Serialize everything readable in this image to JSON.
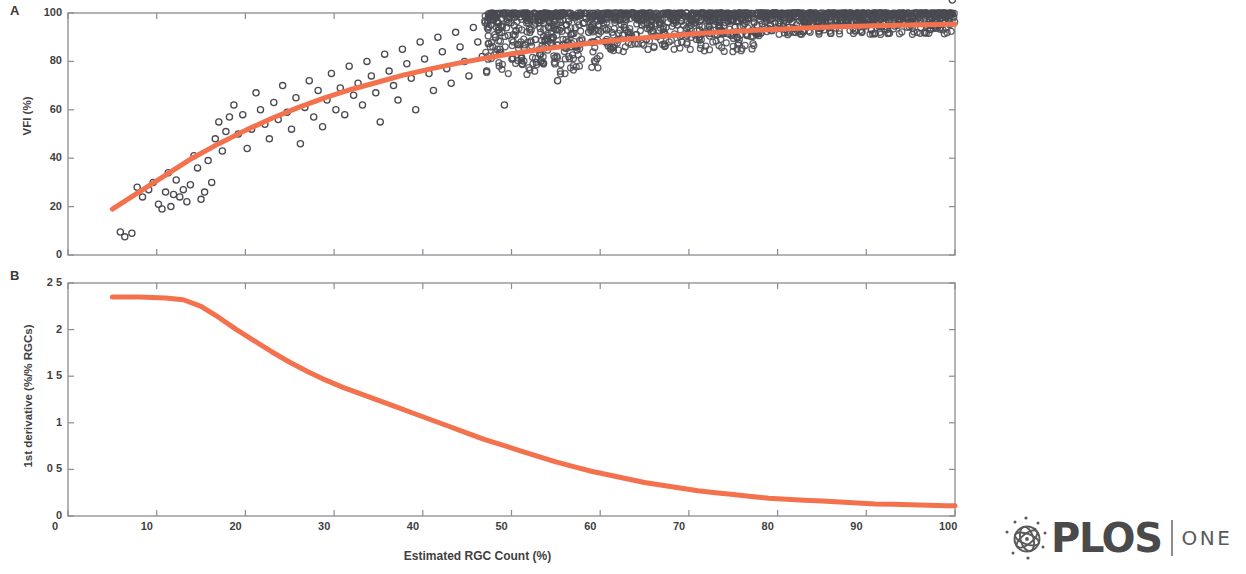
{
  "figure": {
    "panel_a_letter": "A",
    "panel_b_letter": "B",
    "xlabel": "Estimated RGC Count (%)",
    "ylabel_a": "VFI (%)",
    "ylabel_b": "1st derivative (%/% RGCs)"
  },
  "logo": {
    "wordmark": "PLOS",
    "journal": "ONE",
    "emblem_icon": "plos-sphere-icon"
  },
  "colors": {
    "curve": "#F4714E",
    "marker_stroke": "#4a4a52",
    "axis": "#8b8b93",
    "text": "#3f3f42"
  },
  "chart_data": [
    {
      "type": "scatter",
      "panel": "A",
      "title": "",
      "xlabel": "Estimated RGC Count (%)",
      "ylabel": "VFI (%)",
      "xlim": [
        0,
        100
      ],
      "ylim": [
        0,
        100
      ],
      "xticks": [
        0,
        10,
        20,
        30,
        40,
        50,
        60,
        70,
        80,
        90,
        100
      ],
      "yticks": [
        0,
        20,
        40,
        60,
        80,
        100
      ],
      "xtick_labels": [
        "0",
        "10",
        "20",
        "30",
        "40",
        "50",
        "60",
        "70",
        "80",
        "90",
        "100"
      ],
      "ytick_labels": [
        "0",
        "20",
        "40",
        "60",
        "80",
        "100"
      ],
      "grid": false,
      "legend": "none",
      "marker": "open-circle",
      "series": [
        {
          "name": "Observed eyes",
          "x": [
            5.9,
            6.4,
            7.2,
            7.8,
            8.4,
            9.1,
            9.6,
            10.2,
            10.6,
            11.0,
            11.3,
            11.6,
            11.9,
            12.2,
            12.6,
            13.0,
            13.4,
            13.8,
            14.2,
            14.6,
            15.0,
            15.4,
            15.8,
            16.2,
            16.6,
            17.0,
            17.4,
            17.8,
            18.2,
            18.7,
            19.2,
            19.7,
            20.2,
            20.7,
            21.2,
            21.7,
            22.2,
            22.7,
            23.2,
            23.7,
            24.2,
            24.7,
            25.2,
            25.7,
            26.2,
            26.7,
            27.2,
            27.7,
            28.2,
            28.7,
            29.2,
            29.7,
            30.2,
            30.7,
            31.2,
            31.7,
            32.2,
            32.7,
            33.2,
            33.7,
            34.2,
            34.7,
            35.2,
            35.7,
            36.2,
            36.7,
            37.2,
            37.7,
            38.2,
            38.7,
            39.2,
            39.7,
            40.2,
            40.7,
            41.2,
            41.7,
            42.2,
            42.7,
            43.2,
            43.7,
            44.2,
            44.7,
            45.2,
            45.7,
            46.2,
            46.7,
            47.2,
            47.7,
            48.2,
            48.7,
            49.2,
            49.7,
            50.2,
            50.7,
            51.2,
            51.7,
            52.2,
            52.7,
            53.2,
            53.7,
            54.2,
            54.7,
            55.2,
            55.7,
            56.2,
            56.7,
            57.2,
            57.7,
            58.2,
            58.7,
            59.2,
            59.7,
            60.2,
            60.7,
            61.2,
            61.7,
            62.2,
            62.7,
            63.2,
            63.7,
            64.2,
            64.7,
            65.2,
            65.7,
            66.2,
            66.7,
            67.2,
            67.7,
            68.2,
            68.7,
            69.2,
            69.7,
            70.2,
            70.7,
            71.2,
            71.7,
            72.2,
            72.7,
            73.2,
            73.7,
            74.2,
            74.7,
            75.2,
            75.7,
            76.2,
            76.7,
            77.2,
            77.7,
            78.2,
            78.7,
            79.2,
            79.7,
            80.2,
            80.7,
            81.2,
            81.7,
            82.2,
            82.7,
            83.2,
            83.7,
            84.2,
            84.7,
            85.2,
            85.7,
            86.2,
            86.7,
            87.2,
            87.7,
            88.2,
            88.7,
            89.2,
            89.7,
            90.2,
            90.7,
            91.2,
            91.7,
            92.2,
            92.7,
            93.2,
            93.7,
            94.2,
            94.7,
            95.2,
            95.7,
            96.2,
            96.7,
            97.2,
            97.7,
            98.2,
            98.7,
            99.2,
            99.7
          ],
          "y": [
            9.5,
            7.5,
            9.0,
            28.0,
            24.0,
            27.0,
            30.0,
            21.0,
            19.0,
            26.0,
            34.0,
            20.0,
            25.0,
            31.0,
            24.0,
            27.0,
            22.0,
            29.0,
            41.0,
            36.0,
            23.0,
            26.0,
            39.0,
            30.0,
            48.0,
            55.0,
            43.0,
            51.0,
            57.0,
            62.0,
            50.0,
            58.0,
            44.0,
            52.0,
            67.0,
            60.0,
            54.0,
            48.0,
            63.0,
            56.0,
            70.0,
            59.0,
            52.0,
            65.0,
            46.0,
            61.0,
            72.0,
            57.0,
            68.0,
            53.0,
            64.0,
            75.0,
            60.0,
            69.0,
            58.0,
            78.0,
            66.0,
            71.0,
            62.0,
            80.0,
            74.0,
            67.0,
            55.0,
            83.0,
            76.0,
            70.0,
            64.0,
            85.0,
            79.0,
            73.0,
            60.0,
            88.0,
            81.0,
            75.0,
            68.0,
            90.0,
            84.0,
            77.0,
            71.0,
            92.0,
            86.0,
            80.0,
            74.0,
            94.0,
            88.0,
            82.0,
            76.0,
            95.0,
            90.0,
            85.0,
            62.0,
            96.0,
            91.0,
            87.0,
            79.0,
            97.0,
            93.0,
            89.0,
            83.0,
            98.0,
            94.0,
            90.0,
            72.0,
            99.0,
            95.0,
            91.0,
            86.0,
            99.0,
            96.0,
            92.0,
            88.0,
            100.0,
            97.0,
            93.0,
            85.0,
            100.0,
            97.0,
            94.0,
            90.0,
            100.0,
            98.0,
            95.0,
            89.0,
            100.0,
            98.0,
            96.0,
            92.0,
            100.0,
            98.0,
            95.0,
            88.0,
            100.0,
            99.0,
            96.0,
            93.0,
            100.0,
            99.0,
            97.0,
            91.0,
            100.0,
            99.0,
            97.0,
            94.0,
            100.0,
            99.0,
            98.0,
            93.0,
            100.0,
            99.0,
            98.0,
            95.0,
            100.0,
            99.0,
            98.0,
            94.0,
            100.0,
            100.0,
            98.0,
            96.0,
            100.0,
            100.0,
            99.0,
            95.0,
            100.0,
            100.0,
            99.0,
            97.0,
            100.0,
            100.0,
            99.0,
            96.0,
            100.0,
            100.0,
            99.0,
            98.0,
            100.0,
            100.0,
            99.0,
            97.0,
            100.0,
            100.0,
            100.0,
            98.0,
            100.0,
            100.0,
            100.0,
            97.0,
            100.0,
            100.0,
            100.0,
            99.0
          ]
        }
      ],
      "fit_curve": {
        "name": "Fitted nonlinear model",
        "color": "#F4714E",
        "x": [
          5,
          8,
          11,
          14,
          17,
          20,
          23,
          26,
          29,
          32,
          35,
          38,
          41,
          44,
          47,
          50,
          53,
          56,
          59,
          62,
          65,
          68,
          71,
          74,
          77,
          80,
          83,
          86,
          89,
          92,
          95,
          98,
          100
        ],
        "y": [
          19.0,
          26.0,
          33.0,
          40.0,
          46.0,
          51.5,
          56.5,
          61.0,
          65.0,
          68.5,
          71.5,
          74.5,
          77.0,
          79.3,
          81.3,
          83.2,
          84.8,
          86.3,
          87.6,
          88.8,
          89.8,
          90.7,
          91.5,
          92.2,
          92.8,
          93.3,
          93.8,
          94.2,
          94.5,
          94.8,
          95.0,
          95.2,
          95.3
        ]
      }
    },
    {
      "type": "line",
      "panel": "B",
      "title": "",
      "xlabel": "Estimated RGC Count (%)",
      "ylabel": "1st derivative (%/% RGCs)",
      "xlim": [
        0,
        100
      ],
      "ylim": [
        0,
        2.5
      ],
      "xticks": [
        0,
        10,
        20,
        30,
        40,
        50,
        60,
        70,
        80,
        90,
        100
      ],
      "yticks": [
        0,
        0.5,
        1,
        1.5,
        2,
        2.5
      ],
      "xtick_labels": [
        "0",
        "10",
        "20",
        "30",
        "40",
        "50",
        "60",
        "70",
        "80",
        "90",
        "100"
      ],
      "ytick_labels": [
        "0",
        "0 5",
        "1",
        "1 5",
        "2",
        "2 5"
      ],
      "grid": false,
      "legend": "none",
      "series": [
        {
          "name": "1st derivative of fit",
          "color": "#F4714E",
          "x": [
            5,
            8,
            11,
            13,
            15,
            17,
            19,
            21,
            23,
            25,
            27,
            29,
            31,
            33,
            35,
            37,
            39,
            41,
            43,
            45,
            47,
            49,
            51,
            53,
            55,
            57,
            59,
            61,
            63,
            65,
            67,
            69,
            71,
            73,
            75,
            77,
            79,
            81,
            83,
            85,
            87,
            89,
            91,
            93,
            95,
            97,
            99,
            100
          ],
          "y": [
            2.35,
            2.35,
            2.34,
            2.32,
            2.25,
            2.13,
            2.0,
            1.88,
            1.76,
            1.65,
            1.55,
            1.46,
            1.38,
            1.31,
            1.24,
            1.17,
            1.1,
            1.03,
            0.96,
            0.89,
            0.82,
            0.76,
            0.7,
            0.64,
            0.58,
            0.53,
            0.48,
            0.44,
            0.4,
            0.36,
            0.33,
            0.3,
            0.27,
            0.25,
            0.23,
            0.21,
            0.19,
            0.18,
            0.17,
            0.16,
            0.15,
            0.14,
            0.13,
            0.125,
            0.12,
            0.115,
            0.11,
            0.11
          ]
        }
      ]
    }
  ]
}
